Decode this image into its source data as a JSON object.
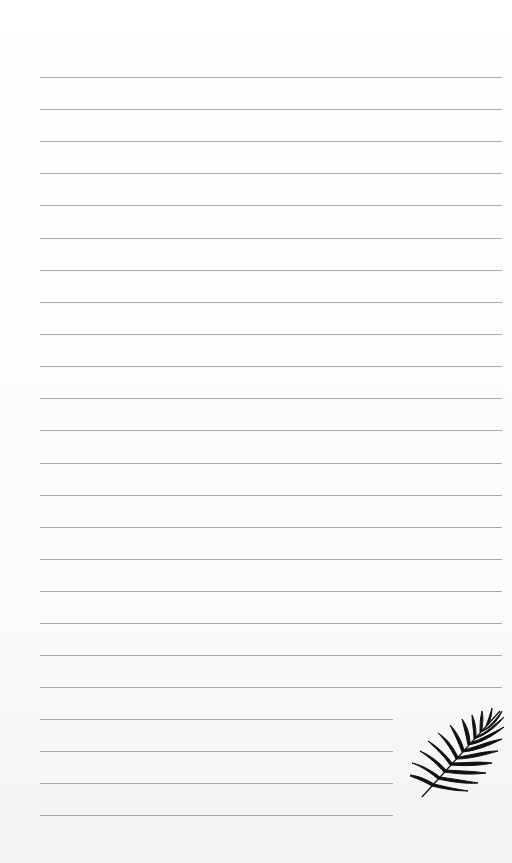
{
  "page": {
    "type": "lined-notepaper",
    "background_color": "#fdfdfd",
    "line_color": "#a9a9a9",
    "line_left": 40,
    "full_line_right": 502,
    "short_line_right": 393,
    "lines": [
      {
        "y": 77,
        "short": false
      },
      {
        "y": 109,
        "short": false
      },
      {
        "y": 141,
        "short": false
      },
      {
        "y": 173,
        "short": false
      },
      {
        "y": 205,
        "short": false
      },
      {
        "y": 238,
        "short": false
      },
      {
        "y": 270,
        "short": false
      },
      {
        "y": 302,
        "short": false
      },
      {
        "y": 334,
        "short": false
      },
      {
        "y": 366,
        "short": false
      },
      {
        "y": 398,
        "short": false
      },
      {
        "y": 430,
        "short": false
      },
      {
        "y": 463,
        "short": false
      },
      {
        "y": 495,
        "short": false
      },
      {
        "y": 527,
        "short": false
      },
      {
        "y": 559,
        "short": false
      },
      {
        "y": 591,
        "short": false
      },
      {
        "y": 623,
        "short": false
      },
      {
        "y": 655,
        "short": false
      },
      {
        "y": 687,
        "short": false
      },
      {
        "y": 719,
        "short": true
      },
      {
        "y": 751,
        "short": true
      },
      {
        "y": 783,
        "short": true
      },
      {
        "y": 815,
        "short": true
      }
    ],
    "decoration": {
      "icon": "palm-leaf-icon",
      "color": "#111111"
    }
  }
}
